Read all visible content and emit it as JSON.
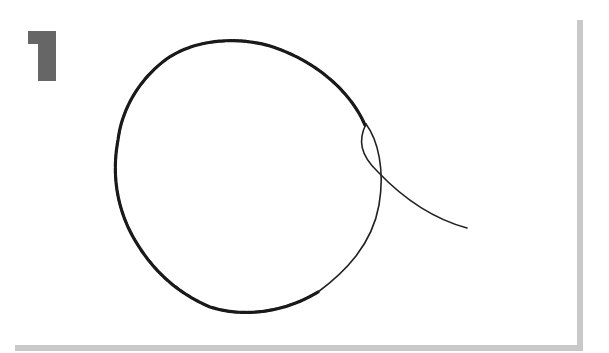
{
  "step": {
    "number": "1",
    "color": "#666666"
  },
  "illustration": {
    "subject": "wire-loop",
    "description": "Twisted wire formed into a circular loop with one loose strand extending out to the lower right",
    "stroke_color": "#1a1a1a"
  },
  "frame": {
    "shadow_color": "#c9c9c9"
  }
}
